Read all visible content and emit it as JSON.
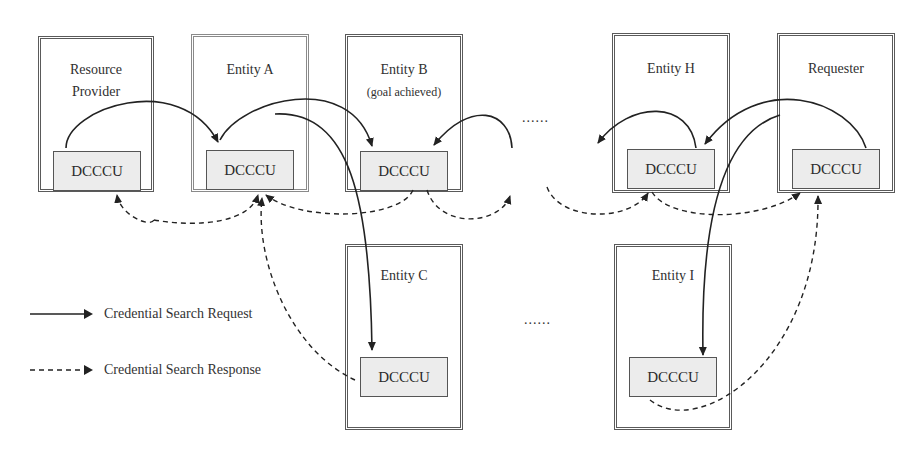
{
  "diagram": {
    "entities": [
      {
        "id": "resource-provider",
        "label_lines": [
          "Resource",
          "Provider"
        ],
        "module": "DCCCU"
      },
      {
        "id": "entity-a",
        "label_lines": [
          "Entity A"
        ],
        "module": "DCCCU"
      },
      {
        "id": "entity-b",
        "label_lines": [
          "Entity B",
          "(goal achieved)"
        ],
        "module": "DCCCU"
      },
      {
        "id": "entity-c",
        "label_lines": [
          "Entity C"
        ],
        "module": "DCCCU"
      },
      {
        "id": "entity-h",
        "label_lines": [
          "Entity H"
        ],
        "module": "DCCCU"
      },
      {
        "id": "entity-i",
        "label_lines": [
          "Entity I"
        ],
        "module": "DCCCU"
      },
      {
        "id": "requester",
        "label_lines": [
          "Requester"
        ],
        "module": "DCCCU"
      }
    ],
    "ellipsis_top": "......",
    "ellipsis_bottom": "......",
    "legend": {
      "request": "Credential Search Request",
      "response": "Credential Search Response"
    },
    "colors": {
      "border": "#5a5a5a",
      "module_fill": "#ececec",
      "line": "#222222"
    }
  }
}
